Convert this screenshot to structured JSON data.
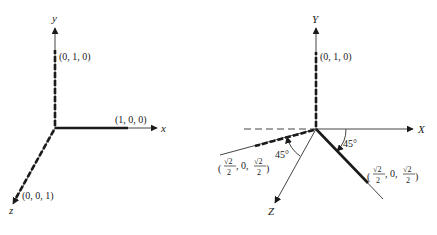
{
  "diagrams": [
    {
      "name": "original-axes",
      "axes": {
        "x": "x",
        "y": "y",
        "z": "z"
      },
      "points": {
        "y_unit": "(0, 1, 0)",
        "x_unit": "(1, 0, 0)",
        "z_unit": "(0, 0, 1)"
      }
    },
    {
      "name": "rotated-axes",
      "axes": {
        "x": "X",
        "y": "Y",
        "z": "Z"
      },
      "points": {
        "y_unit": "(0, 1, 0)",
        "rotated_left": {
          "open": "(",
          "num1": "√2",
          "den1": "2",
          "mid": ", 0, ",
          "num2": "√2",
          "den2": "2",
          "close": ")"
        },
        "rotated_right": {
          "open": "(",
          "num1": "√2",
          "den1": "2",
          "mid": ", 0, ",
          "num2": "√2",
          "den2": "2",
          "close": ")"
        }
      },
      "angles": {
        "left": "45°",
        "right": "45°"
      }
    }
  ],
  "colors": {
    "line": "#1a1a1a",
    "thin": "#444444"
  }
}
